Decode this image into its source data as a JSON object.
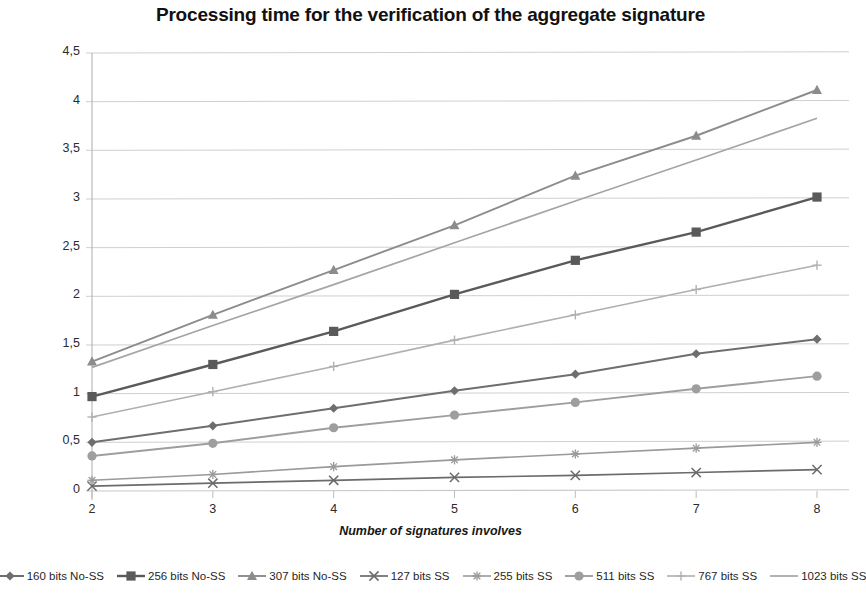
{
  "chart_data": {
    "type": "line",
    "title": "Processing time for the verification of the aggregate signature",
    "xlabel": "Number of signatures involves",
    "ylabel": "Time (s)",
    "x": [
      2,
      3,
      4,
      5,
      6,
      7,
      8
    ],
    "xtick_labels": [
      "2",
      "3",
      "4",
      "5",
      "6",
      "7",
      "8"
    ],
    "ytick_labels": [
      "0",
      "0,5",
      "1",
      "1,5",
      "2",
      "2,5",
      "3",
      "3,5",
      "4",
      "4,5"
    ],
    "ytick_values": [
      0,
      0.5,
      1,
      1.5,
      2,
      2.5,
      3,
      3.5,
      4,
      4.5
    ],
    "xlim": [
      2,
      8
    ],
    "ylim": [
      0,
      4.5
    ],
    "grid": "horizontal",
    "legend_position": "bottom",
    "series": [
      {
        "name": "160 bits No-SS",
        "marker": "diamond",
        "color": "#6e6e6e",
        "line_width": 2.0,
        "values": [
          0.5,
          0.67,
          0.85,
          1.03,
          1.2,
          1.41,
          1.56
        ]
      },
      {
        "name": "256 bits No-SS",
        "marker": "square",
        "color": "#5a5a5a",
        "line_width": 2.4,
        "values": [
          0.97,
          1.3,
          1.64,
          2.02,
          2.37,
          2.66,
          3.02
        ]
      },
      {
        "name": "307 bits No-SS",
        "marker": "triangle",
        "color": "#8c8c8c",
        "line_width": 1.9,
        "values": [
          1.33,
          1.81,
          2.27,
          2.73,
          3.24,
          3.65,
          4.12
        ]
      },
      {
        "name": "127 bits SS",
        "marker": "x",
        "color": "#6b6b6b",
        "line_width": 1.7,
        "values": [
          0.05,
          0.08,
          0.11,
          0.14,
          0.16,
          0.19,
          0.22
        ]
      },
      {
        "name": "255 bits SS",
        "marker": "star",
        "color": "#9a9a9a",
        "line_width": 1.6,
        "values": [
          0.11,
          0.17,
          0.25,
          0.32,
          0.38,
          0.44,
          0.5
        ]
      },
      {
        "name": "511 bits SS",
        "marker": "circle",
        "color": "#9e9e9e",
        "line_width": 1.9,
        "values": [
          0.36,
          0.49,
          0.65,
          0.78,
          0.91,
          1.05,
          1.18
        ]
      },
      {
        "name": "767 bits SS",
        "marker": "plus",
        "color": "#b0b0b0",
        "line_width": 1.6,
        "values": [
          0.76,
          1.02,
          1.28,
          1.55,
          1.81,
          2.07,
          2.32
        ]
      },
      {
        "name": "1023 bits SS",
        "marker": "none",
        "color": "#a5a5a5",
        "line_width": 1.7,
        "values": [
          1.27,
          1.7,
          2.12,
          2.55,
          2.98,
          3.4,
          3.83
        ]
      }
    ]
  }
}
